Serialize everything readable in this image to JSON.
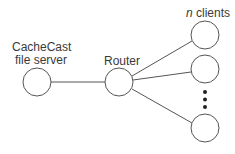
{
  "diagram": {
    "server_label_line1": "CacheCast",
    "server_label_line2": "file server",
    "router_label": "Router",
    "clients_label_n": "n",
    "clients_label_rest": " clients",
    "stroke_color": "#555555"
  }
}
